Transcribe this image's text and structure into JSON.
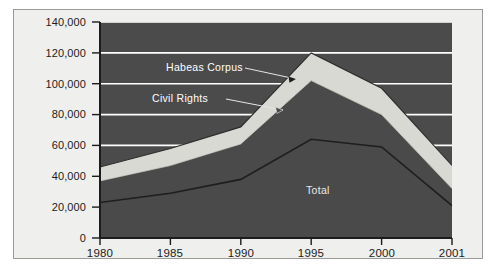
{
  "chart_data": {
    "type": "area",
    "title": "",
    "subtitle": "",
    "xlabel": "",
    "ylabel": "",
    "x": [
      "1980",
      "1985",
      "1990",
      "1995",
      "2000",
      "2001"
    ],
    "categories": [
      "1980",
      "1985",
      "1990",
      "1995",
      "2000",
      "2001"
    ],
    "xtick_labels": [
      "1980",
      "1985",
      "1990",
      "1995",
      "2000",
      "2001"
    ],
    "ytick_labels": [
      "0",
      "20,000",
      "40,000",
      "60,000",
      "80,000",
      "100,000",
      "120,000",
      "140,000"
    ],
    "ytick_values": [
      0,
      20000,
      40000,
      60000,
      80000,
      100000,
      120000,
      140000
    ],
    "ylim": [
      0,
      140000
    ],
    "grid": "horizontal",
    "legend_position": "inline-annotations",
    "stacking": "cumulative-boundaries",
    "series": [
      {
        "name": "Total",
        "label": "Total",
        "color": "#4a4a4a",
        "values": [
          23000,
          29000,
          38000,
          64000,
          59000,
          21000
        ]
      },
      {
        "name": "Civil Rights",
        "label": "Civil Rights",
        "color": "#4a4a4a",
        "values": [
          37000,
          47000,
          61000,
          102000,
          80000,
          32000
        ]
      },
      {
        "name": "Habeas Corpus",
        "label": "Habeas Corpus",
        "color": "#d9d9d4",
        "values": [
          46000,
          58000,
          72000,
          120000,
          97000,
          47000
        ]
      }
    ],
    "annotations": [
      {
        "text": "Habeas Corpus",
        "x": 1991.0,
        "y": 108000
      },
      {
        "text": "Civil Rights",
        "x": 1990.2,
        "y": 88000
      },
      {
        "text": "Total",
        "x": 1996.4,
        "y": 33000
      }
    ],
    "colors": {
      "plot_background": "#4a4a4a",
      "band_fill": "#d9d9d4",
      "figure_background": "#efefed",
      "gridline": "#ffffff",
      "axis": "#1c1c1c",
      "frame_border": "#9a9a96",
      "tick_text": "#1c1c1c",
      "annotation_text": "#ffffff"
    }
  },
  "axes": {
    "y_ticks": [
      {
        "label": "140,000",
        "value": 140000
      },
      {
        "label": "120,000",
        "value": 120000
      },
      {
        "label": "100,000",
        "value": 100000
      },
      {
        "label": "80,000",
        "value": 80000
      },
      {
        "label": "60,000",
        "value": 60000
      },
      {
        "label": "40,000",
        "value": 40000
      },
      {
        "label": "20,000",
        "value": 20000
      },
      {
        "label": "0",
        "value": 0
      }
    ],
    "x_ticks": [
      {
        "label": "1980"
      },
      {
        "label": "1985"
      },
      {
        "label": "1990"
      },
      {
        "label": "1995"
      },
      {
        "label": "2000"
      },
      {
        "label": "2001"
      }
    ]
  },
  "labels": {
    "habeas_corpus": "Habeas Corpus",
    "civil_rights": "Civil Rights",
    "total": "Total"
  }
}
